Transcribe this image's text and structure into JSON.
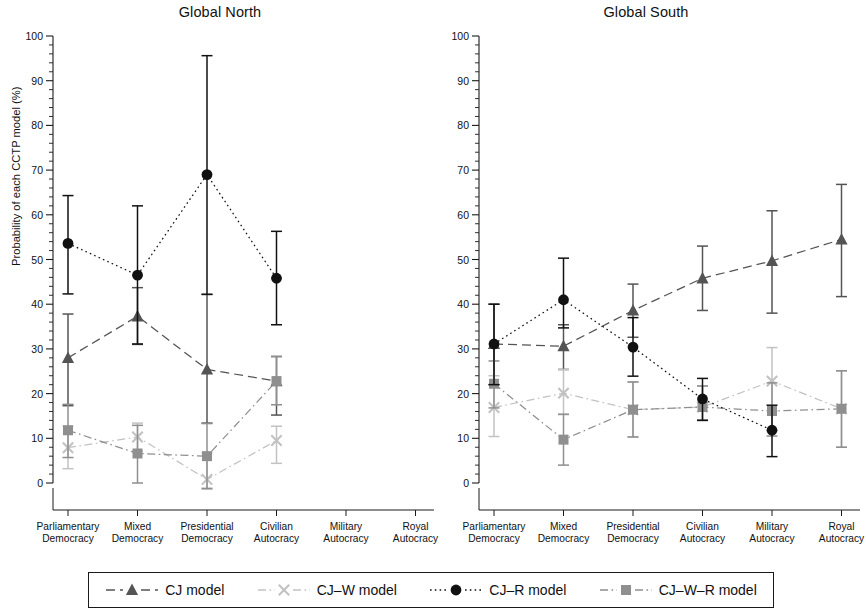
{
  "figure": {
    "ylabel": "Probability of each CCTP model (%)",
    "yticks": [
      0,
      10,
      20,
      30,
      40,
      50,
      60,
      70,
      80,
      90,
      100
    ],
    "minor_tick_step": 2,
    "ylim": [
      -7,
      103
    ],
    "categories": [
      "Parliamentary\nDemocracy",
      "Mixed\nDemocracy",
      "Presidential\nDemocracy",
      "Civilian\nAutocracy",
      "Military\nAutocracy",
      "Royal\nAutocracy"
    ],
    "category_labels": [
      [
        "Parliamentary",
        "Democracy"
      ],
      [
        "Mixed",
        "Democracy"
      ],
      [
        "Presidential",
        "Democracy"
      ],
      [
        "Civilian",
        "Autocracy"
      ],
      [
        "Military",
        "Autocracy"
      ],
      [
        "Royal",
        "Autocracy"
      ]
    ]
  },
  "legend": {
    "items": [
      {
        "label": "CJ model",
        "marker": "triangle",
        "color": "#545454",
        "line": "dashed"
      },
      {
        "label": "CJ–W model",
        "marker": "cross",
        "color": "#c2c2c2",
        "line": "dashdot"
      },
      {
        "label": "CJ–R model",
        "marker": "circle",
        "color": "#111111",
        "line": "dotted"
      },
      {
        "label": "CJ–W–R model",
        "marker": "square",
        "color": "#8f8f8f",
        "line": "dashdot"
      }
    ]
  },
  "chart_data": [
    {
      "type": "line",
      "title": "Global North",
      "xlabel": "",
      "ylabel": "Probability of each CCTP model (%)",
      "ylim": [
        0,
        100
      ],
      "grid": false,
      "legend_position": "bottom",
      "categories": [
        "Parliamentary Democracy",
        "Mixed Democracy",
        "Presidential Democracy",
        "Civilian Autocracy",
        "Military Autocracy",
        "Royal Autocracy"
      ],
      "series": [
        {
          "name": "CJ model",
          "marker": "triangle",
          "color": "#545454",
          "values": [
            28.0,
            37.3,
            25.4,
            22.8,
            null,
            null
          ],
          "ci_low": [
            17.3,
            31.0,
            13.4,
            15.2,
            null,
            null
          ],
          "ci_high": [
            37.8,
            43.7,
            42.2,
            28.3,
            null,
            null
          ]
        },
        {
          "name": "CJ–W model",
          "marker": "cross",
          "color": "#c2c2c2",
          "values": [
            7.9,
            10.3,
            0.8,
            9.5,
            null,
            null
          ],
          "ci_low": [
            3.2,
            7.1,
            -1.4,
            4.4,
            null,
            null
          ],
          "ci_high": [
            12.7,
            13.4,
            6.8,
            12.7,
            null,
            null
          ]
        },
        {
          "name": "CJ–R model",
          "marker": "circle",
          "color": "#111111",
          "values": [
            53.6,
            46.5,
            69.0,
            45.8,
            null,
            null
          ],
          "ci_low": [
            42.3,
            31.1,
            42.2,
            35.4,
            null,
            null
          ],
          "ci_high": [
            64.3,
            62.0,
            95.6,
            56.3,
            null,
            null
          ]
        },
        {
          "name": "CJ–W–R model",
          "marker": "square",
          "color": "#8f8f8f",
          "values": [
            11.8,
            6.6,
            6.0,
            22.8,
            null,
            null
          ],
          "ci_low": [
            5.7,
            0.0,
            -1.2,
            17.5,
            null,
            null
          ],
          "ci_high": [
            17.6,
            12.9,
            13.3,
            28.3,
            null,
            null
          ]
        }
      ]
    },
    {
      "type": "line",
      "title": "Global South",
      "xlabel": "",
      "ylabel": "",
      "ylim": [
        0,
        100
      ],
      "grid": false,
      "legend_position": "bottom",
      "categories": [
        "Parliamentary Democracy",
        "Mixed Democracy",
        "Presidential Democracy",
        "Civilian Autocracy",
        "Military Autocracy",
        "Royal Autocracy"
      ],
      "series": [
        {
          "name": "CJ model",
          "marker": "triangle",
          "color": "#545454",
          "values": [
            31.1,
            30.6,
            38.6,
            45.8,
            49.7,
            54.5
          ],
          "ci_low": [
            22.0,
            25.4,
            32.6,
            38.6,
            38.0,
            41.7
          ],
          "ci_high": [
            40.0,
            35.4,
            44.5,
            53.0,
            60.9,
            66.8
          ]
        },
        {
          "name": "CJ–W model",
          "marker": "cross",
          "color": "#c2c2c2",
          "values": [
            16.9,
            20.1,
            16.4,
            17.0,
            22.8,
            16.6
          ],
          "ci_low": [
            10.4,
            15.3,
            10.3,
            14.1,
            16.1,
            8.0
          ],
          "ci_high": [
            24.0,
            25.4,
            22.6,
            21.7,
            30.3,
            25.1
          ]
        },
        {
          "name": "CJ–R model",
          "marker": "circle",
          "color": "#111111",
          "values": [
            31.1,
            41.0,
            30.4,
            18.8,
            11.8,
            null
          ],
          "ci_low": [
            22.0,
            34.7,
            23.9,
            14.0,
            5.9,
            null
          ],
          "ci_high": [
            40.0,
            50.3,
            37.0,
            23.4,
            17.4,
            null
          ]
        },
        {
          "name": "CJ–W–R model",
          "marker": "square",
          "color": "#8f8f8f",
          "values": [
            22.2,
            9.7,
            16.4,
            17.0,
            16.1,
            16.6
          ],
          "ci_low": [
            16.8,
            4.0,
            10.3,
            14.1,
            10.5,
            8.0
          ],
          "ci_high": [
            27.3,
            15.4,
            22.6,
            21.7,
            22.4,
            25.1
          ]
        }
      ]
    }
  ]
}
